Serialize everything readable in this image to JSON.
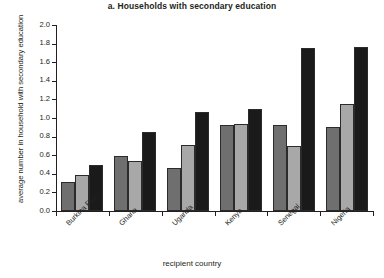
{
  "chart_data": {
    "type": "bar",
    "title": "a. Households with secondary education",
    "xlabel": "recipient country",
    "ylabel": "average number in household with secondary education",
    "categories": [
      "Burkina Faso",
      "Ghana",
      "Uganda",
      "Kenya",
      "Senegal",
      "Nigeria"
    ],
    "series": [
      {
        "name": "series-1",
        "color": "#706f6f",
        "values": [
          0.31,
          0.59,
          0.46,
          0.92,
          0.93,
          0.9
        ]
      },
      {
        "name": "series-2",
        "color": "#a8a8a8",
        "values": [
          0.39,
          0.54,
          0.71,
          0.94,
          0.7,
          1.15
        ]
      },
      {
        "name": "series-3",
        "color": "#1a1a1a",
        "values": [
          0.5,
          0.85,
          1.07,
          1.1,
          1.75,
          1.76
        ]
      }
    ],
    "ylim": [
      0.0,
      2.0
    ],
    "ytick_values": [
      0.0,
      0.2,
      0.4,
      0.6,
      0.8,
      1.0,
      1.2,
      1.4,
      1.6,
      1.8,
      2.0
    ],
    "ytick_labels": [
      "0.0",
      "0.2",
      "0.4",
      "0.6",
      "0.8",
      "1.0",
      "1.2",
      "1.4",
      "1.6",
      "1.8",
      "2.0"
    ],
    "grid": false,
    "legend": "none"
  }
}
